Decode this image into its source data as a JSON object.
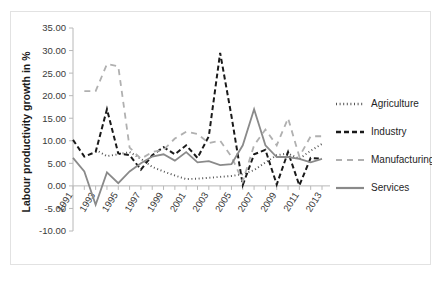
{
  "chart_data": {
    "type": "line",
    "title": "",
    "subtitle": "",
    "xlabel": "",
    "ylabel": "Labour productivity growth in %",
    "ylim": [
      -10.0,
      35.0
    ],
    "ytick_step": 5.0,
    "ytick_labels": [
      "35.00",
      "30.00",
      "25.00",
      "20.00",
      "15.00",
      "10.00",
      "5.00",
      "0.00",
      "-5.00",
      "-10.00"
    ],
    "ytick_values": [
      35.0,
      30.0,
      25.0,
      20.0,
      15.0,
      10.0,
      5.0,
      0.0,
      -5.0,
      -10.0
    ],
    "x": [
      1991,
      1992,
      1993,
      1994,
      1995,
      1996,
      1997,
      1998,
      1999,
      2000,
      2001,
      2002,
      2003,
      2004,
      2005,
      2006,
      2007,
      2008,
      2009,
      2010,
      2011,
      2012,
      2013
    ],
    "xtick_labels": [
      "1991",
      "1993",
      "1995",
      "1997",
      "1999",
      "2001",
      "2003",
      "2005",
      "2007",
      "2009",
      "2011",
      "2013"
    ],
    "xtick_values": [
      1991,
      1993,
      1995,
      1997,
      1999,
      2001,
      2003,
      2005,
      2007,
      2009,
      2011,
      2013
    ],
    "xlim": [
      1991,
      2013
    ],
    "grid": false,
    "legend_position": "right",
    "series": [
      {
        "name": "Agriculture",
        "style": "dotted",
        "color": "#555555",
        "values": [
          null,
          null,
          8.0,
          6.6,
          7.0,
          7.5,
          6.0,
          4.2,
          3.2,
          2.3,
          1.5,
          1.6,
          1.8,
          2.0,
          2.2,
          2.6,
          3.5,
          5.2,
          6.8,
          7.2,
          6.0,
          7.8,
          9.3
        ]
      },
      {
        "name": "Industry",
        "style": "dashed",
        "color": "#1a1a1a",
        "values": [
          10.2,
          6.5,
          7.5,
          17.0,
          7.2,
          6.8,
          3.6,
          6.8,
          8.6,
          7.0,
          9.0,
          6.2,
          11.0,
          29.5,
          15.5,
          0.2,
          7.0,
          8.0,
          0.3,
          7.5,
          0.1,
          6.2,
          6.0
        ]
      },
      {
        "name": "Manufacturing",
        "style": "dashed-light",
        "color": "#b0b0b0",
        "values": [
          null,
          21.0,
          21.0,
          27.0,
          26.5,
          8.5,
          6.0,
          7.5,
          8.0,
          10.5,
          12.0,
          11.5,
          9.5,
          10.0,
          6.5,
          1.0,
          9.0,
          12.5,
          9.0,
          15.0,
          6.5,
          11.0,
          11.0
        ]
      },
      {
        "name": "Services",
        "style": "solid",
        "color": "#8a8a8a",
        "values": [
          6.2,
          3.2,
          -4.2,
          3.0,
          0.6,
          3.2,
          5.0,
          6.5,
          7.0,
          5.6,
          7.5,
          5.2,
          5.5,
          4.6,
          4.8,
          9.0,
          17.0,
          9.0,
          6.4,
          6.4,
          6.0,
          5.2,
          6.0
        ]
      }
    ]
  },
  "legend": {
    "items": [
      {
        "label": "Agriculture"
      },
      {
        "label": "Industry"
      },
      {
        "label": "Manufacturing"
      },
      {
        "label": "Services"
      }
    ]
  }
}
